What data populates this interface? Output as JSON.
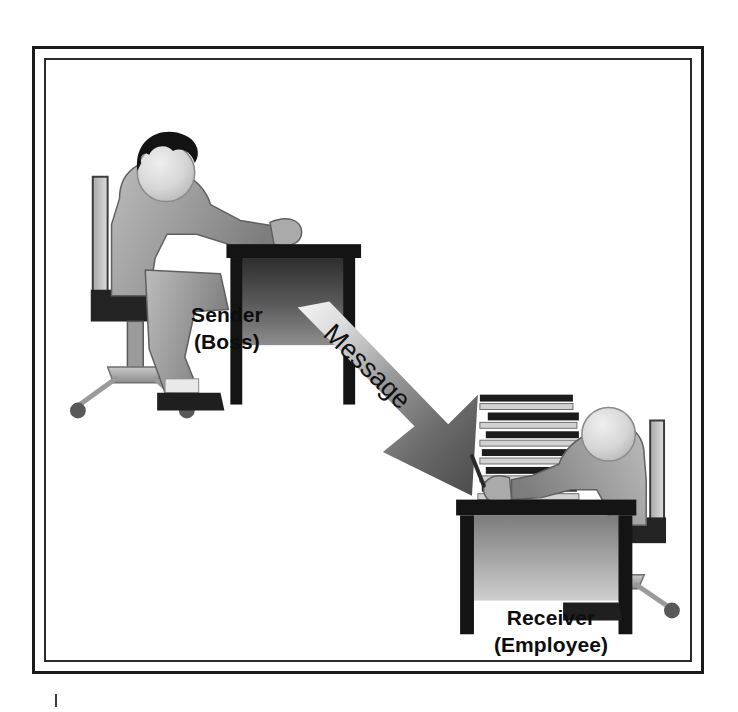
{
  "diagram": {
    "background_color": "#ffffff",
    "frame": {
      "outer_border_color": "#1a1a1a",
      "inner_border_color": "#2b2b2b"
    },
    "nodes": [
      {
        "id": "sender",
        "role": "Sender",
        "label": "Sender",
        "sublabel": "(Boss)",
        "icon": "person-at-desk-sender",
        "description": "Seated figure with dark hair at an office desk in an office chair"
      },
      {
        "id": "receiver",
        "role": "Receiver",
        "label": "Receiver",
        "sublabel": "(Employee)",
        "icon": "person-at-desk-receiver",
        "description": "Seated figure holding a pen at a desk with a tall stack of papers"
      }
    ],
    "connector": {
      "id": "message-arrow",
      "label": "Message",
      "from": "sender",
      "to": "receiver",
      "direction": "down-right",
      "style": "gradient-tapered-arrow",
      "gradient_from": "#f2f2f2",
      "gradient_to": "#4f4f4f",
      "label_rotation_deg": 42,
      "label_color": "#111111"
    },
    "palette": {
      "ink": "#0d0d0d",
      "body_light": "#b9b9b9",
      "body_mid": "#8e8e8e",
      "body_dark": "#6a6a6a",
      "furniture_dark": "#1f1f1f",
      "furniture_mid": "#4a4a4a",
      "paper_light": "#d8d8d8",
      "white": "#ffffff"
    }
  },
  "page": {
    "crop_tick": "|"
  }
}
